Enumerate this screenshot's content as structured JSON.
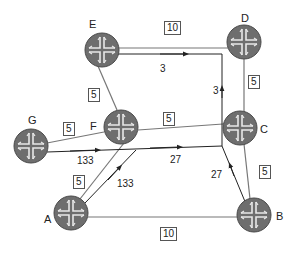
{
  "colors": {
    "router_fill": "#6e6e6e",
    "router_edge": "#4a4a4a",
    "router_cross": "#e8e8e8",
    "link": "#777777",
    "path": "#222222"
  },
  "nodes": [
    {
      "id": "E",
      "label": "E",
      "x": 102,
      "y": 50
    },
    {
      "id": "D",
      "label": "D",
      "x": 244,
      "y": 42
    },
    {
      "id": "G",
      "label": "G",
      "x": 31,
      "y": 146
    },
    {
      "id": "F",
      "label": "F",
      "x": 121,
      "y": 127
    },
    {
      "id": "C",
      "label": "C",
      "x": 240,
      "y": 128
    },
    {
      "id": "A",
      "label": "A",
      "x": 71,
      "y": 213
    },
    {
      "id": "B",
      "label": "B",
      "x": 254,
      "y": 215
    }
  ],
  "links": [
    {
      "from": "E",
      "to": "D",
      "metric": "10"
    },
    {
      "from": "E",
      "to": "F",
      "metric": "5"
    },
    {
      "from": "G",
      "to": "F",
      "metric": "5"
    },
    {
      "from": "F",
      "to": "C",
      "metric": "5"
    },
    {
      "from": "D",
      "to": "C",
      "metric": "5"
    },
    {
      "from": "A",
      "to": "F",
      "metric": "5"
    },
    {
      "from": "C",
      "to": "B",
      "metric": "5"
    },
    {
      "from": "A",
      "to": "B",
      "metric": "10"
    }
  ],
  "metric_labels": {
    "E_D": "10",
    "E_F": "5",
    "G_F": "5",
    "F_C": "5",
    "D_C": "5",
    "A_F": "5",
    "C_B": "5",
    "A_B": "10"
  },
  "flow_labels": {
    "g_flow": "133",
    "a_flow": "133",
    "merged_flow": "27",
    "b_flow": "27",
    "up_flow": "3",
    "top_flow": "3"
  }
}
